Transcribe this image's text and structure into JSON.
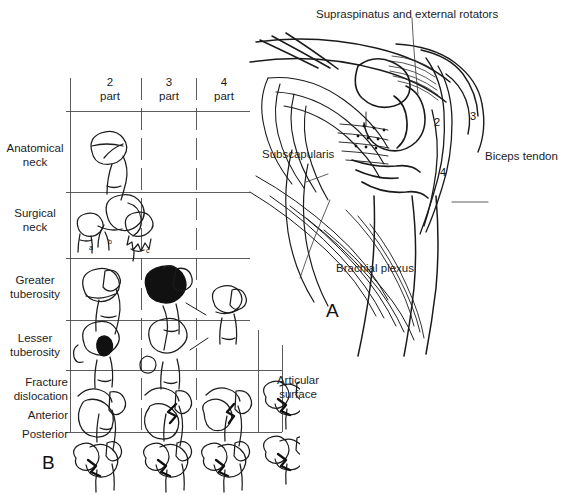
{
  "figure": {
    "type": "medical-illustration",
    "background_color": "#ffffff",
    "ink_color": "#1a1a1a"
  },
  "panel_a": {
    "label": "A",
    "caption_labels": [
      {
        "name": "supraspinatus-label",
        "text": "Supraspinatus and external rotators"
      },
      {
        "name": "subscapularis-label",
        "text": "Subscapularis"
      },
      {
        "name": "biceps-tendon-label",
        "text": "Biceps tendon"
      },
      {
        "name": "brachial-plexus-label",
        "text": "Brachial plexus"
      }
    ],
    "fragment_numbers": [
      {
        "name": "fragment-2",
        "text": "2"
      },
      {
        "name": "fragment-3",
        "text": "3"
      },
      {
        "name": "fragment-4",
        "text": "4"
      }
    ]
  },
  "panel_b": {
    "label": "B",
    "column_headers": [
      {
        "line1": "2",
        "line2": "part"
      },
      {
        "line1": "3",
        "line2": "part"
      },
      {
        "line1": "4",
        "line2": "part"
      }
    ],
    "extra_column_header": "Articular\nsurface",
    "row_labels": [
      {
        "name": "row-anatomical-neck",
        "text": "Anatomical\nneck"
      },
      {
        "name": "row-surgical-neck",
        "text": "Surgical\nneck"
      },
      {
        "name": "row-greater-tuberosity",
        "text": "Greater\ntuberosity"
      },
      {
        "name": "row-lesser-tuberosity",
        "text": "Lesser\ntuberosity"
      },
      {
        "name": "row-fracture-dislocation",
        "text": "Fracture\ndislocation"
      },
      {
        "name": "row-anterior",
        "text": "Anterior"
      },
      {
        "name": "row-posterior",
        "text": "Posterior"
      }
    ],
    "sub_labels": [
      "a",
      "b",
      "c"
    ]
  }
}
